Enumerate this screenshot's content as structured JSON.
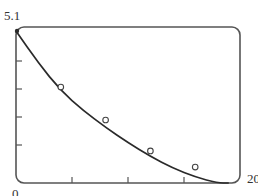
{
  "chart_data": {
    "type": "scatter",
    "title": "",
    "xlabel": "",
    "ylabel": "",
    "xlim": [
      0,
      20
    ],
    "ylim": [
      0,
      5.1
    ],
    "grid": false,
    "legend": null,
    "x_tick_labels": [
      "0",
      "20"
    ],
    "y_tick_labels": [
      "5.1"
    ],
    "x_ticks": [
      0,
      5,
      10,
      15,
      20
    ],
    "y_ticks": [
      0,
      1.02,
      2.04,
      3.06,
      4.08,
      5.1
    ],
    "series": [
      {
        "name": "data",
        "marker": "open-circle",
        "x": [
          4,
          8,
          12,
          16
        ],
        "y": [
          3.14,
          2.06,
          1.05,
          0.52
        ]
      },
      {
        "name": "fitted-curve",
        "marker": "line",
        "x": [
          0,
          2,
          4,
          6,
          8,
          10,
          12,
          14,
          16,
          18,
          19
        ],
        "y": [
          5.1,
          4.05,
          3.15,
          2.5,
          1.95,
          1.45,
          1.0,
          0.62,
          0.33,
          0.08,
          0.0
        ]
      }
    ]
  },
  "labels": {
    "y_max": "5.1",
    "x_min": "0",
    "x_max": "20"
  },
  "colors": {
    "frame": "#555555",
    "curve": "#2a2a2a",
    "marker": "#444444"
  }
}
